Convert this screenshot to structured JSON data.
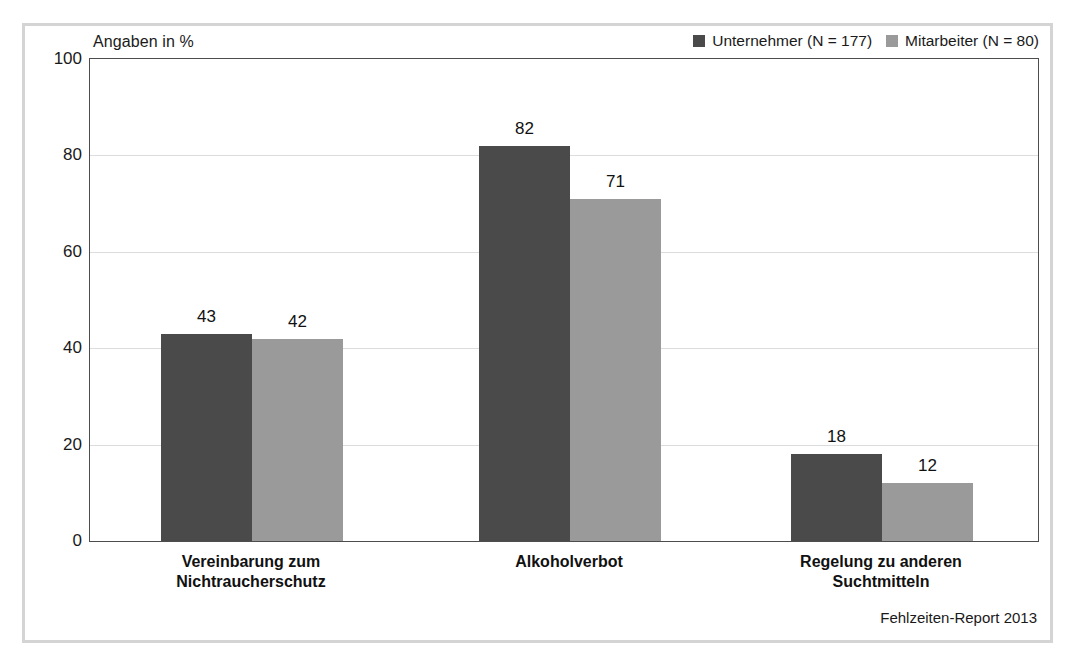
{
  "figure": {
    "units_caption": "Angaben in %",
    "source_note": "Fehlzeiten-Report 2013"
  },
  "legend": {
    "position": "top-right",
    "entries": [
      {
        "label": "Unternehmer (N = 177)",
        "color": "#4a4a4a",
        "swatch_name": "legend-swatch-unternehmer"
      },
      {
        "label": "Mitarbeiter (N = 80)",
        "color": "#9a9a9a",
        "swatch_name": "legend-swatch-mitarbeiter"
      }
    ]
  },
  "axes": {
    "y_ticks": [
      "0",
      "20",
      "40",
      "60",
      "80",
      "100"
    ],
    "y_tick_values": [
      0,
      20,
      40,
      60,
      80,
      100
    ],
    "x_categories": [
      "Vereinbarung zum\nNichtraucherschutz",
      "Alkoholverbot",
      "Regelung zu anderen\nSuchtmitteln"
    ]
  },
  "chart_data": {
    "type": "bar",
    "title": "",
    "subtitle": "",
    "xlabel": "",
    "ylabel": "Angaben in %",
    "ylim": [
      0,
      100
    ],
    "grid": true,
    "legend_position": "top-right",
    "categories": [
      "Vereinbarung zum Nichtraucherschutz",
      "Alkoholverbot",
      "Regelung zu anderen Suchtmitteln"
    ],
    "series": [
      {
        "name": "Unternehmer (N = 177)",
        "color": "#4a4a4a",
        "values": [
          43,
          42,
          82
        ],
        "values_correct": [
          43,
          82,
          18
        ]
      },
      {
        "name": "Mitarbeiter (N = 80)",
        "color": "#9a9a9a",
        "values": [
          42,
          71,
          12
        ]
      }
    ],
    "data_labels": [
      {
        "category": "Vereinbarung zum Nichtraucherschutz",
        "series": "Unternehmer (N = 177)",
        "value": 43
      },
      {
        "category": "Vereinbarung zum Nichtraucherschutz",
        "series": "Mitarbeiter (N = 80)",
        "value": 42
      },
      {
        "category": "Alkoholverbot",
        "series": "Unternehmer (N = 177)",
        "value": 82
      },
      {
        "category": "Alkoholverbot",
        "series": "Mitarbeiter (N = 80)",
        "value": 71
      },
      {
        "category": "Regelung zu anderen Suchtmitteln",
        "series": "Unternehmer (N = 177)",
        "value": 18
      },
      {
        "category": "Regelung zu anderen Suchtmitteln",
        "series": "Mitarbeiter (N = 80)",
        "value": 12
      }
    ],
    "annotations": [
      "Angaben in %",
      "Fehlzeiten-Report 2013"
    ]
  },
  "layout": {
    "plot": {
      "left": 89,
      "top": 58,
      "width": 948,
      "height": 482
    },
    "bar_width": 91,
    "group_starts": [
      160,
      478,
      790
    ]
  }
}
